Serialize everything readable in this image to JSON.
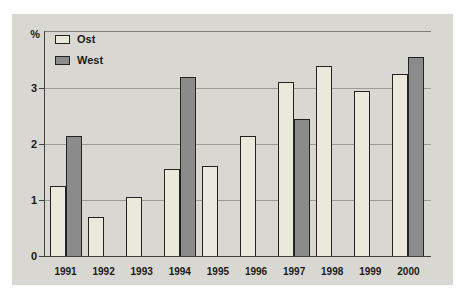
{
  "figure": {
    "background": "#ffffff",
    "panel_background": "#d8d7d2",
    "gridline_color": "#9b9a95",
    "axis_color": "#3f3f3e",
    "text_color": "#1a1a1a"
  },
  "chart_data": {
    "type": "bar",
    "title": "",
    "ylabel": "%",
    "xlabel": "",
    "categories": [
      "1991",
      "1992",
      "1993",
      "1994",
      "1995",
      "1996",
      "1997",
      "1998",
      "1999",
      "2000"
    ],
    "series": [
      {
        "name": "Ost",
        "color": "#ebe9dc",
        "values": [
          1.25,
          0.7,
          1.05,
          1.55,
          1.6,
          2.15,
          3.1,
          3.4,
          2.95,
          3.25
        ]
      },
      {
        "name": "West",
        "color": "#8b8b8c",
        "values": [
          2.15,
          null,
          null,
          3.2,
          null,
          null,
          2.45,
          null,
          null,
          3.55
        ]
      }
    ],
    "ylim": [
      0,
      4
    ],
    "yticks": [
      0,
      1,
      2,
      3
    ],
    "grid": true,
    "legend_position": "top-left"
  }
}
